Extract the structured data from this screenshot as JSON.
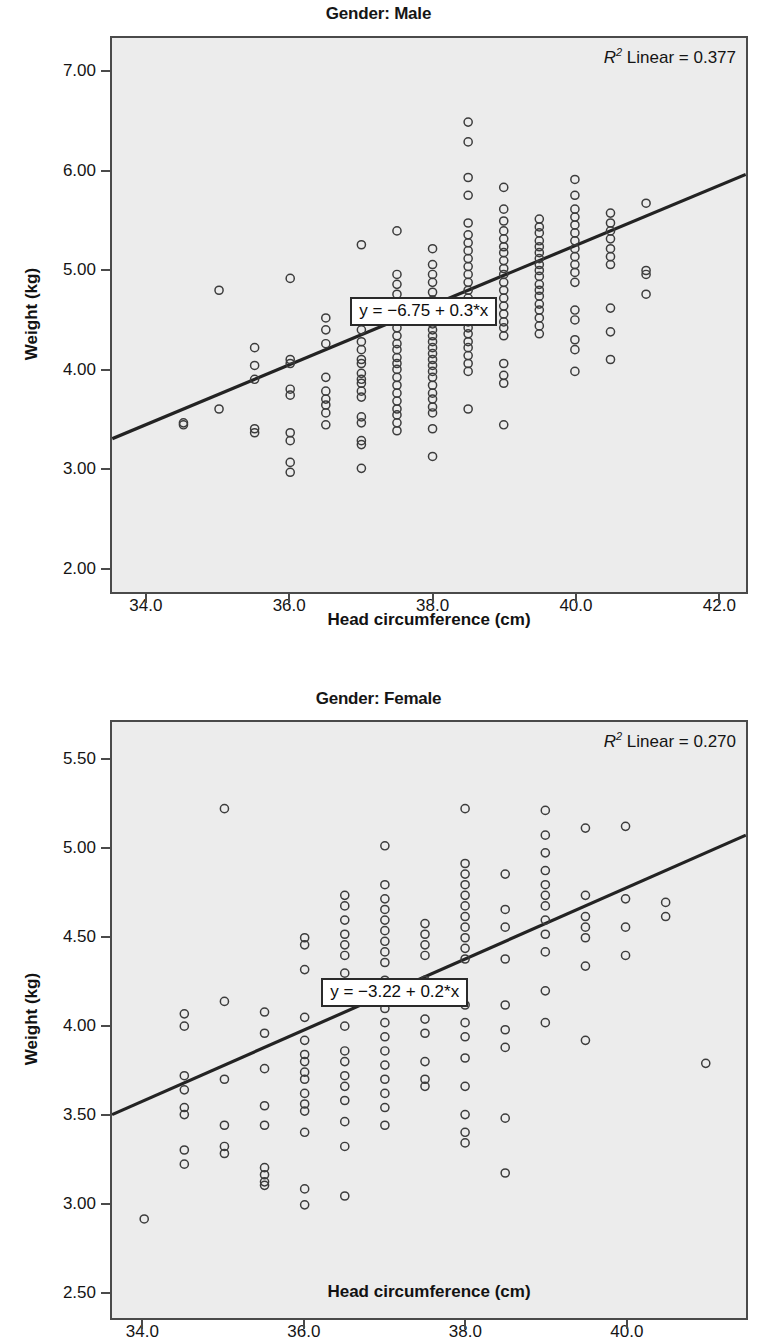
{
  "figure": {
    "xlabel": "Head circumference (cm)",
    "ylabel": "Weight (kg)"
  },
  "chart_data": [
    {
      "type": "scatter",
      "panel_id": "male",
      "title": "Gender: Male",
      "xlabel": "Head circumference (cm)",
      "ylabel": "Weight (kg)",
      "xlim": [
        33.5,
        42.4
      ],
      "ylim": [
        1.75,
        7.35
      ],
      "xticks": [
        "34.0",
        "36.0",
        "38.0",
        "40.0",
        "42.0"
      ],
      "xtick_values": [
        34.0,
        36.0,
        38.0,
        40.0,
        42.0
      ],
      "yticks": [
        "2.00",
        "3.00",
        "4.00",
        "5.00",
        "6.00",
        "7.00"
      ],
      "ytick_values": [
        2.0,
        3.0,
        4.0,
        5.0,
        6.0,
        7.0
      ],
      "grid": false,
      "r2_label": "Linear = 0.377",
      "r2_value": 0.377,
      "fit_equation": "y = −6.75 + 0.3*x",
      "fit_intercept": -6.75,
      "fit_slope": 0.3,
      "marker": "open-circle",
      "points": [
        [
          34.5,
          3.44
        ],
        [
          34.5,
          3.46
        ],
        [
          35.0,
          4.8
        ],
        [
          35.0,
          3.6
        ],
        [
          35.5,
          4.22
        ],
        [
          35.5,
          4.04
        ],
        [
          35.5,
          3.9
        ],
        [
          35.5,
          3.4
        ],
        [
          35.5,
          3.36
        ],
        [
          36.0,
          4.92
        ],
        [
          36.0,
          4.1
        ],
        [
          36.0,
          4.06
        ],
        [
          36.0,
          3.8
        ],
        [
          36.0,
          3.74
        ],
        [
          36.0,
          3.36
        ],
        [
          36.0,
          3.28
        ],
        [
          36.0,
          3.06
        ],
        [
          36.0,
          2.96
        ],
        [
          36.5,
          4.52
        ],
        [
          36.5,
          4.4
        ],
        [
          36.5,
          4.26
        ],
        [
          36.5,
          3.92
        ],
        [
          36.5,
          3.78
        ],
        [
          36.5,
          3.7
        ],
        [
          36.5,
          3.64
        ],
        [
          36.5,
          3.56
        ],
        [
          36.5,
          3.44
        ],
        [
          37.0,
          5.26
        ],
        [
          37.0,
          4.62
        ],
        [
          37.0,
          4.56
        ],
        [
          37.0,
          4.4
        ],
        [
          37.0,
          4.28
        ],
        [
          37.0,
          4.2
        ],
        [
          37.0,
          4.1
        ],
        [
          37.0,
          4.06
        ],
        [
          37.0,
          3.96
        ],
        [
          37.0,
          3.9
        ],
        [
          37.0,
          3.86
        ],
        [
          37.0,
          3.78
        ],
        [
          37.0,
          3.72
        ],
        [
          37.0,
          3.52
        ],
        [
          37.0,
          3.46
        ],
        [
          37.0,
          3.28
        ],
        [
          37.0,
          3.24
        ],
        [
          37.0,
          3.0
        ],
        [
          37.5,
          5.4
        ],
        [
          37.5,
          4.96
        ],
        [
          37.5,
          4.86
        ],
        [
          37.5,
          4.76
        ],
        [
          37.5,
          4.66
        ],
        [
          37.5,
          4.58
        ],
        [
          37.5,
          4.5
        ],
        [
          37.5,
          4.42
        ],
        [
          37.5,
          4.34
        ],
        [
          37.5,
          4.26
        ],
        [
          37.5,
          4.2
        ],
        [
          37.5,
          4.12
        ],
        [
          37.5,
          4.06
        ],
        [
          37.5,
          4.0
        ],
        [
          37.5,
          3.92
        ],
        [
          37.5,
          3.84
        ],
        [
          37.5,
          3.76
        ],
        [
          37.5,
          3.68
        ],
        [
          37.5,
          3.6
        ],
        [
          37.5,
          3.54
        ],
        [
          37.5,
          3.46
        ],
        [
          37.5,
          3.38
        ],
        [
          38.0,
          5.22
        ],
        [
          38.0,
          5.06
        ],
        [
          38.0,
          4.96
        ],
        [
          38.0,
          4.88
        ],
        [
          38.0,
          4.78
        ],
        [
          38.0,
          4.7
        ],
        [
          38.0,
          4.62
        ],
        [
          38.0,
          4.54
        ],
        [
          38.0,
          4.46
        ],
        [
          38.0,
          4.4
        ],
        [
          38.0,
          4.34
        ],
        [
          38.0,
          4.28
        ],
        [
          38.0,
          4.22
        ],
        [
          38.0,
          4.16
        ],
        [
          38.0,
          4.1
        ],
        [
          38.0,
          4.04
        ],
        [
          38.0,
          3.98
        ],
        [
          38.0,
          3.92
        ],
        [
          38.0,
          3.84
        ],
        [
          38.0,
          3.76
        ],
        [
          38.0,
          3.7
        ],
        [
          38.0,
          3.62
        ],
        [
          38.0,
          3.56
        ],
        [
          38.0,
          3.4
        ],
        [
          38.0,
          3.12
        ],
        [
          38.5,
          6.5
        ],
        [
          38.5,
          6.3
        ],
        [
          38.5,
          5.94
        ],
        [
          38.5,
          5.76
        ],
        [
          38.5,
          5.48
        ],
        [
          38.5,
          5.36
        ],
        [
          38.5,
          5.28
        ],
        [
          38.5,
          5.2
        ],
        [
          38.5,
          5.12
        ],
        [
          38.5,
          5.04
        ],
        [
          38.5,
          4.96
        ],
        [
          38.5,
          4.88
        ],
        [
          38.5,
          4.8
        ],
        [
          38.5,
          4.72
        ],
        [
          38.5,
          4.64
        ],
        [
          38.5,
          4.56
        ],
        [
          38.5,
          4.48
        ],
        [
          38.5,
          4.42
        ],
        [
          38.5,
          4.36
        ],
        [
          38.5,
          4.28
        ],
        [
          38.5,
          4.22
        ],
        [
          38.5,
          4.14
        ],
        [
          38.5,
          4.06
        ],
        [
          38.5,
          3.98
        ],
        [
          38.5,
          3.6
        ],
        [
          39.0,
          5.84
        ],
        [
          39.0,
          5.62
        ],
        [
          39.0,
          5.5
        ],
        [
          39.0,
          5.4
        ],
        [
          39.0,
          5.32
        ],
        [
          39.0,
          5.24
        ],
        [
          39.0,
          5.18
        ],
        [
          39.0,
          5.1
        ],
        [
          39.0,
          5.02
        ],
        [
          39.0,
          4.96
        ],
        [
          39.0,
          4.88
        ],
        [
          39.0,
          4.8
        ],
        [
          39.0,
          4.72
        ],
        [
          39.0,
          4.64
        ],
        [
          39.0,
          4.56
        ],
        [
          39.0,
          4.48
        ],
        [
          39.0,
          4.42
        ],
        [
          39.0,
          4.34
        ],
        [
          39.0,
          4.06
        ],
        [
          39.0,
          3.94
        ],
        [
          39.0,
          3.86
        ],
        [
          39.0,
          3.44
        ],
        [
          39.5,
          5.52
        ],
        [
          39.5,
          5.44
        ],
        [
          39.5,
          5.38
        ],
        [
          39.5,
          5.3
        ],
        [
          39.5,
          5.24
        ],
        [
          39.5,
          5.18
        ],
        [
          39.5,
          5.12
        ],
        [
          39.5,
          5.06
        ],
        [
          39.5,
          5.0
        ],
        [
          39.5,
          4.94
        ],
        [
          39.5,
          4.86
        ],
        [
          39.5,
          4.8
        ],
        [
          39.5,
          4.74
        ],
        [
          39.5,
          4.66
        ],
        [
          39.5,
          4.6
        ],
        [
          39.5,
          4.52
        ],
        [
          39.5,
          4.44
        ],
        [
          39.5,
          4.36
        ],
        [
          40.0,
          5.92
        ],
        [
          40.0,
          5.76
        ],
        [
          40.0,
          5.62
        ],
        [
          40.0,
          5.54
        ],
        [
          40.0,
          5.46
        ],
        [
          40.0,
          5.38
        ],
        [
          40.0,
          5.3
        ],
        [
          40.0,
          5.22
        ],
        [
          40.0,
          5.14
        ],
        [
          40.0,
          5.06
        ],
        [
          40.0,
          4.98
        ],
        [
          40.0,
          4.88
        ],
        [
          40.0,
          4.6
        ],
        [
          40.0,
          4.5
        ],
        [
          40.0,
          4.3
        ],
        [
          40.0,
          4.2
        ],
        [
          40.0,
          3.98
        ],
        [
          40.5,
          5.58
        ],
        [
          40.5,
          5.48
        ],
        [
          40.5,
          5.4
        ],
        [
          40.5,
          5.32
        ],
        [
          40.5,
          5.22
        ],
        [
          40.5,
          5.14
        ],
        [
          40.5,
          5.06
        ],
        [
          40.5,
          4.62
        ],
        [
          40.5,
          4.38
        ],
        [
          40.5,
          4.1
        ],
        [
          41.0,
          5.68
        ],
        [
          41.0,
          5.0
        ],
        [
          41.0,
          4.96
        ],
        [
          41.0,
          4.76
        ]
      ]
    },
    {
      "type": "scatter",
      "panel_id": "female",
      "title": "Gender: Female",
      "xlabel": "Head circumference (cm)",
      "ylabel": "Weight (kg)",
      "xlim": [
        33.6,
        41.5
      ],
      "ylim": [
        2.35,
        5.72
      ],
      "xticks": [
        "34.0",
        "36.0",
        "38.0",
        "40.0"
      ],
      "xtick_values": [
        34.0,
        36.0,
        38.0,
        40.0
      ],
      "yticks": [
        "2.50",
        "3.00",
        "3.50",
        "4.00",
        "4.50",
        "5.00",
        "5.50"
      ],
      "ytick_values": [
        2.5,
        3.0,
        3.5,
        4.0,
        4.5,
        5.0,
        5.5
      ],
      "grid": false,
      "r2_label": "Linear = 0.270",
      "r2_value": 0.27,
      "fit_equation": "y = −3.22 + 0.2*x",
      "fit_intercept": -3.22,
      "fit_slope": 0.2,
      "marker": "open-circle",
      "points": [
        [
          34.0,
          2.91
        ],
        [
          34.5,
          4.07
        ],
        [
          34.5,
          4.0
        ],
        [
          34.5,
          3.72
        ],
        [
          34.5,
          3.64
        ],
        [
          34.5,
          3.54
        ],
        [
          34.5,
          3.5
        ],
        [
          34.5,
          3.3
        ],
        [
          34.5,
          3.22
        ],
        [
          35.0,
          5.23
        ],
        [
          35.0,
          4.14
        ],
        [
          35.0,
          3.7
        ],
        [
          35.0,
          3.44
        ],
        [
          35.0,
          3.32
        ],
        [
          35.0,
          3.28
        ],
        [
          35.5,
          4.08
        ],
        [
          35.5,
          3.96
        ],
        [
          35.5,
          3.76
        ],
        [
          35.5,
          3.55
        ],
        [
          35.5,
          3.44
        ],
        [
          35.5,
          3.2
        ],
        [
          35.5,
          3.16
        ],
        [
          35.5,
          3.12
        ],
        [
          35.5,
          3.1
        ],
        [
          36.0,
          4.5
        ],
        [
          36.0,
          4.46
        ],
        [
          36.0,
          4.32
        ],
        [
          36.0,
          4.05
        ],
        [
          36.0,
          3.92
        ],
        [
          36.0,
          3.84
        ],
        [
          36.0,
          3.8
        ],
        [
          36.0,
          3.74
        ],
        [
          36.0,
          3.7
        ],
        [
          36.0,
          3.62
        ],
        [
          36.0,
          3.56
        ],
        [
          36.0,
          3.52
        ],
        [
          36.0,
          3.4
        ],
        [
          36.0,
          3.08
        ],
        [
          36.0,
          2.99
        ],
        [
          36.5,
          4.74
        ],
        [
          36.5,
          4.68
        ],
        [
          36.5,
          4.6
        ],
        [
          36.5,
          4.52
        ],
        [
          36.5,
          4.46
        ],
        [
          36.5,
          4.4
        ],
        [
          36.5,
          4.3
        ],
        [
          36.5,
          4.14
        ],
        [
          36.5,
          4.0
        ],
        [
          36.5,
          3.86
        ],
        [
          36.5,
          3.8
        ],
        [
          36.5,
          3.72
        ],
        [
          36.5,
          3.66
        ],
        [
          36.5,
          3.58
        ],
        [
          36.5,
          3.46
        ],
        [
          36.5,
          3.32
        ],
        [
          36.5,
          3.04
        ],
        [
          37.0,
          5.02
        ],
        [
          37.0,
          4.8
        ],
        [
          37.0,
          4.72
        ],
        [
          37.0,
          4.66
        ],
        [
          37.0,
          4.6
        ],
        [
          37.0,
          4.54
        ],
        [
          37.0,
          4.48
        ],
        [
          37.0,
          4.42
        ],
        [
          37.0,
          4.36
        ],
        [
          37.0,
          4.26
        ],
        [
          37.0,
          4.1
        ],
        [
          37.0,
          4.02
        ],
        [
          37.0,
          3.94
        ],
        [
          37.0,
          3.86
        ],
        [
          37.0,
          3.78
        ],
        [
          37.0,
          3.7
        ],
        [
          37.0,
          3.62
        ],
        [
          37.0,
          3.54
        ],
        [
          37.0,
          3.44
        ],
        [
          37.5,
          4.58
        ],
        [
          37.5,
          4.52
        ],
        [
          37.5,
          4.46
        ],
        [
          37.5,
          4.4
        ],
        [
          37.5,
          4.26
        ],
        [
          37.5,
          4.18
        ],
        [
          37.5,
          4.04
        ],
        [
          37.5,
          3.96
        ],
        [
          37.5,
          3.8
        ],
        [
          37.5,
          3.7
        ],
        [
          37.5,
          3.66
        ],
        [
          38.0,
          5.23
        ],
        [
          38.0,
          4.92
        ],
        [
          38.0,
          4.86
        ],
        [
          38.0,
          4.8
        ],
        [
          38.0,
          4.74
        ],
        [
          38.0,
          4.68
        ],
        [
          38.0,
          4.62
        ],
        [
          38.0,
          4.56
        ],
        [
          38.0,
          4.5
        ],
        [
          38.0,
          4.44
        ],
        [
          38.0,
          4.38
        ],
        [
          38.0,
          4.12
        ],
        [
          38.0,
          4.02
        ],
        [
          38.0,
          3.94
        ],
        [
          38.0,
          3.82
        ],
        [
          38.0,
          3.66
        ],
        [
          38.0,
          3.5
        ],
        [
          38.0,
          3.4
        ],
        [
          38.0,
          3.34
        ],
        [
          38.5,
          4.86
        ],
        [
          38.5,
          4.66
        ],
        [
          38.5,
          4.56
        ],
        [
          38.5,
          4.38
        ],
        [
          38.5,
          4.12
        ],
        [
          38.5,
          3.98
        ],
        [
          38.5,
          3.88
        ],
        [
          38.5,
          3.48
        ],
        [
          38.5,
          3.17
        ],
        [
          39.0,
          5.22
        ],
        [
          39.0,
          5.08
        ],
        [
          39.0,
          4.98
        ],
        [
          39.0,
          4.88
        ],
        [
          39.0,
          4.8
        ],
        [
          39.0,
          4.74
        ],
        [
          39.0,
          4.68
        ],
        [
          39.0,
          4.6
        ],
        [
          39.0,
          4.52
        ],
        [
          39.0,
          4.42
        ],
        [
          39.0,
          4.2
        ],
        [
          39.0,
          4.02
        ],
        [
          39.5,
          5.12
        ],
        [
          39.5,
          4.74
        ],
        [
          39.5,
          4.62
        ],
        [
          39.5,
          4.56
        ],
        [
          39.5,
          4.5
        ],
        [
          39.5,
          4.34
        ],
        [
          39.5,
          3.92
        ],
        [
          40.0,
          5.13
        ],
        [
          40.0,
          4.72
        ],
        [
          40.0,
          4.56
        ],
        [
          40.0,
          4.4
        ],
        [
          40.5,
          4.7
        ],
        [
          40.5,
          4.62
        ],
        [
          41.0,
          3.79
        ]
      ]
    }
  ]
}
